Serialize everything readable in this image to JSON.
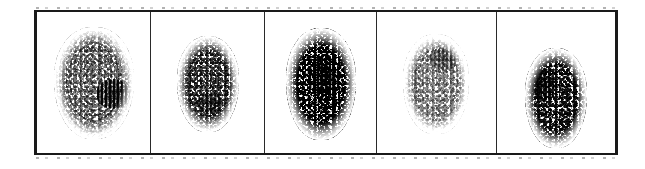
{
  "figure": {
    "kind": "fingerprint-comparison-strip",
    "panel_count": 5,
    "caption": "",
    "background_color": "#ffffff",
    "frame": {
      "border_color": "#1a1a1a",
      "divider_color": "#2a2a2a",
      "x": 34,
      "y": 10,
      "width": 584,
      "height": 145
    }
  },
  "panels": [
    {
      "index": 1,
      "label": "",
      "content": "fingerprint-impression",
      "ink_color": "#111111",
      "density": "light",
      "density_class": "density-light",
      "size": {
        "width": 80,
        "height": 112
      },
      "position": {
        "left": 17,
        "top": 15
      },
      "core": {
        "present": true,
        "width": 34,
        "height": 30,
        "left": 42,
        "top": 52,
        "description": "dark dense smudge on the middle-right"
      },
      "notes": "largest impression; sparse speckle overall with one heavy core blot"
    },
    {
      "index": 2,
      "label": "",
      "content": "fingerprint-impression",
      "ink_color": "#111111",
      "density": "medium",
      "density_class": "density-medium",
      "size": {
        "width": 62,
        "height": 96
      },
      "position": {
        "left": 26,
        "top": 24
      },
      "core": {
        "present": true,
        "width": 26,
        "height": 22,
        "left": 20,
        "top": 56,
        "description": "modest darker band low-centre"
      },
      "notes": "smaller, fairly even mid-tone speckle"
    },
    {
      "index": 3,
      "label": "",
      "content": "fingerprint-impression",
      "ink_color": "#000000",
      "density": "very-heavy",
      "density_class": "density-very-heavy",
      "size": {
        "width": 70,
        "height": 112
      },
      "position": {
        "left": 21,
        "top": 16
      },
      "core": {
        "present": true,
        "width": 32,
        "height": 46,
        "left": 22,
        "top": 26,
        "description": "broad very dark core running down the centre"
      },
      "notes": "darkest and densest of the five impressions"
    },
    {
      "index": 4,
      "label": "",
      "content": "fingerprint-impression",
      "ink_color": "#111111",
      "density": "very-light",
      "density_class": "density-very-light",
      "size": {
        "width": 66,
        "height": 100
      },
      "position": {
        "left": 26,
        "top": 22
      },
      "core": {
        "present": true,
        "width": 30,
        "height": 22,
        "left": 26,
        "top": 14,
        "description": "slightly heavier speckle across the upper half"
      },
      "notes": "faintest impression; fades out toward the lower edge"
    },
    {
      "index": 5,
      "label": "",
      "content": "fingerprint-impression",
      "ink_color": "#111111",
      "density": "heavy",
      "density_class": "density-heavy",
      "size": {
        "width": 62,
        "height": 100
      },
      "position": {
        "left": 28,
        "top": 36
      },
      "core": {
        "present": true,
        "width": 26,
        "height": 34,
        "left": 6,
        "top": 20,
        "description": "dark streaks down the left flank"
      },
      "notes": "sits lower in its cell than the others; strong left-side ridges"
    }
  ]
}
